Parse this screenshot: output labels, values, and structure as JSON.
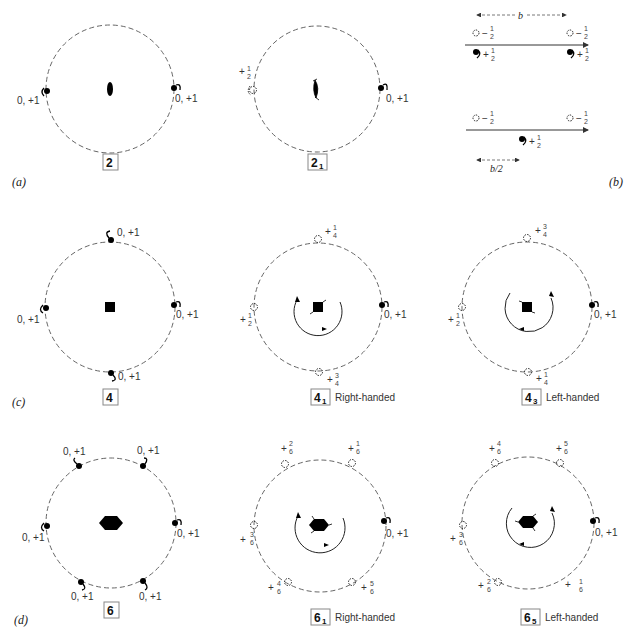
{
  "panels": {
    "a": {
      "tag": "(a)",
      "left": {
        "symbol": "2",
        "symbol_sub": "",
        "labels": {
          "left": "0, +1",
          "right": "0, +1"
        }
      },
      "right": {
        "symbol": "2",
        "symbol_sub": "1",
        "labels": {
          "left_sign": "+",
          "left_num": "1",
          "left_den": "2",
          "right": "0, +1"
        }
      }
    },
    "b": {
      "tag": "(b)",
      "dimension_top": "b",
      "dimension_bottom": "b/2",
      "row1": {
        "upper_left": {
          "sign": "−",
          "num": "1",
          "den": "2"
        },
        "upper_right": {
          "sign": "−",
          "num": "1",
          "den": "2"
        },
        "lower_left": {
          "sign": "+",
          "num": "1",
          "den": "2"
        },
        "lower_right": {
          "sign": "+",
          "num": "1",
          "den": "2"
        }
      },
      "row2": {
        "upper_left": {
          "sign": "−",
          "num": "1",
          "den": "2"
        },
        "upper_right": {
          "sign": "−",
          "num": "1",
          "den": "2"
        },
        "lower_mid": {
          "sign": "+",
          "num": "1",
          "den": "2"
        }
      }
    },
    "c": {
      "tag": "(c)",
      "four": {
        "symbol": "4",
        "labels": {
          "top": "0, +1",
          "left": "0, +1",
          "right": "0, +1",
          "bottom": "0, +1"
        }
      },
      "four_one": {
        "symbol": "4",
        "symbol_sub": "1",
        "handedness": "Right-handed",
        "labels": {
          "top": {
            "sign": "+",
            "num": "1",
            "den": "4"
          },
          "left": {
            "sign": "+",
            "num": "1",
            "den": "2"
          },
          "right": "0, +1",
          "bottom": {
            "sign": "+",
            "num": "3",
            "den": "4"
          }
        }
      },
      "four_three": {
        "symbol": "4",
        "symbol_sub": "3",
        "handedness": "Left-handed",
        "labels": {
          "top": {
            "sign": "+",
            "num": "3",
            "den": "4"
          },
          "left": {
            "sign": "+",
            "num": "1",
            "den": "2"
          },
          "right": "0, +1",
          "bottom": {
            "sign": "+",
            "num": "1",
            "den": "4"
          }
        }
      }
    },
    "d": {
      "tag": "(d)",
      "six": {
        "symbol": "6",
        "labels": {
          "upper_left": "0, +1",
          "upper_right": "0, +1",
          "left": "0, +1",
          "right": "0, +1",
          "lower_left": "0, +1",
          "lower_right": "0, +1"
        }
      },
      "six_one": {
        "symbol": "6",
        "symbol_sub": "1",
        "handedness": "Right-handed",
        "labels": {
          "upper_left": {
            "sign": "+",
            "num": "2",
            "den": "6"
          },
          "upper_right": {
            "sign": "+",
            "num": "1",
            "den": "6"
          },
          "left": {
            "sign": "+",
            "num": "3",
            "den": "6"
          },
          "right": "0, +1",
          "lower_left": {
            "sign": "+",
            "num": "4",
            "den": "6"
          },
          "lower_right": {
            "sign": "+",
            "num": "5",
            "den": "6"
          }
        }
      },
      "six_five": {
        "symbol": "6",
        "symbol_sub": "5",
        "handedness": "Left-handed",
        "labels": {
          "upper_left": {
            "sign": "+",
            "num": "4",
            "den": "6"
          },
          "upper_right": {
            "sign": "+",
            "num": "5",
            "den": "6"
          },
          "left": {
            "sign": "+",
            "num": "3",
            "den": "6"
          },
          "right": "0, +1",
          "lower_left": {
            "sign": "+",
            "num": "2",
            "den": "6"
          },
          "lower_right": {
            "sign": "+",
            "num": "1",
            "den": "6"
          }
        }
      }
    }
  }
}
